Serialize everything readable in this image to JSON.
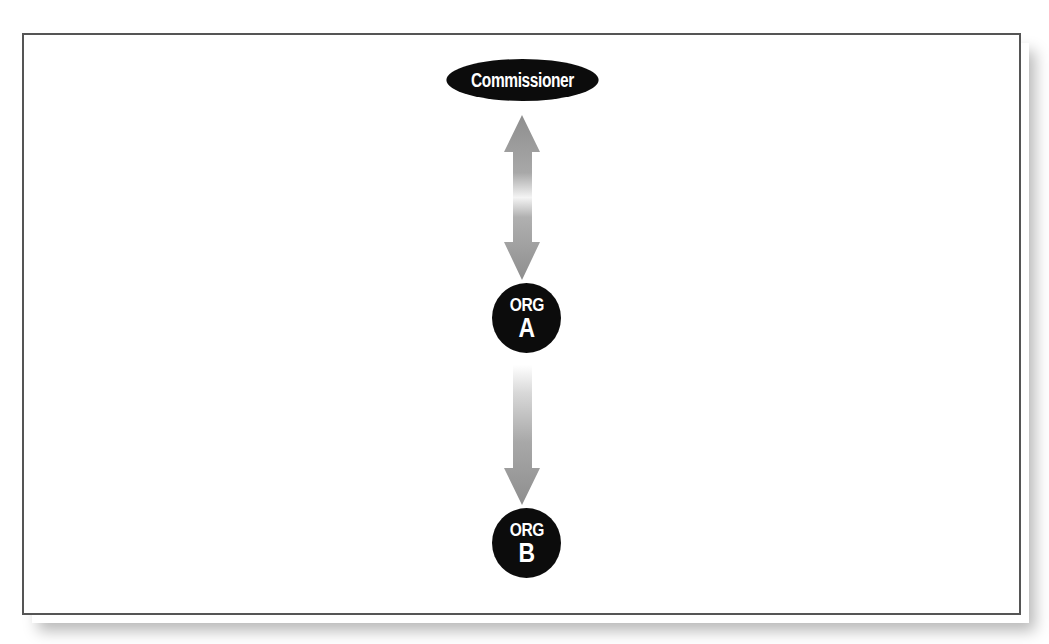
{
  "diagram": {
    "type": "hierarchy",
    "nodes": [
      {
        "id": "commissioner",
        "label": "Commissioner",
        "shape": "ellipse"
      },
      {
        "id": "org_a",
        "label_line1": "ORG",
        "label_line2": "A",
        "shape": "circle"
      },
      {
        "id": "org_b",
        "label_line1": "ORG",
        "label_line2": "B",
        "shape": "circle"
      }
    ],
    "edges": [
      {
        "from": "commissioner",
        "to": "org_a",
        "direction": "bidirectional"
      },
      {
        "from": "org_a",
        "to": "org_b",
        "direction": "one-way"
      }
    ]
  },
  "colors": {
    "node_fill": "#0c0c0c",
    "node_text": "#ffffff",
    "arrow_fill": "#9a9a9a",
    "frame_border": "#555555",
    "background": "#ffffff"
  }
}
